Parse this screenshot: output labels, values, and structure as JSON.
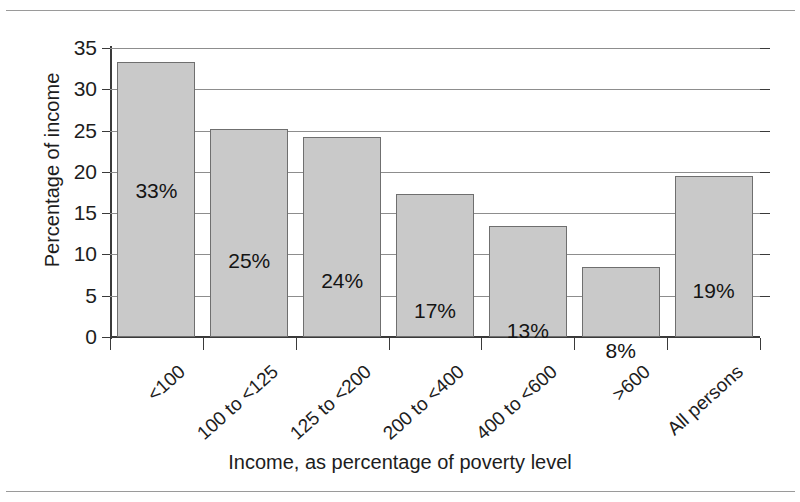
{
  "chart_data": {
    "type": "bar",
    "title": "",
    "xlabel": "Income, as percentage of poverty level",
    "ylabel": "Percentage of income",
    "categories": [
      "<100",
      "100 to <125",
      "125 to <200",
      "200 to <400",
      "400 to <600",
      ">600",
      "All persons"
    ],
    "values": [
      33.3,
      25.2,
      24.2,
      17.3,
      13.4,
      8.5,
      19.5
    ],
    "data_labels": [
      "33%",
      "25%",
      "24%",
      "17%",
      "13%",
      "8%",
      "19%"
    ],
    "ylim": [
      0,
      35
    ],
    "ytick_labels": [
      "0",
      "5",
      "10",
      "15",
      "20",
      "25",
      "30",
      "35"
    ],
    "ytick_values": [
      0,
      5,
      10,
      15,
      20,
      25,
      30,
      35
    ],
    "grid": true,
    "legend": "none",
    "bar_color": "#c9c9c9",
    "bar_edge_color": "#6f6f6f",
    "gridline_color": "#8d8d8d",
    "axis_color": "#3a3a3a",
    "background": "#ffffff"
  }
}
